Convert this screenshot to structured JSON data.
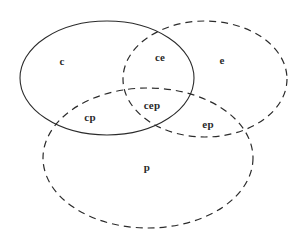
{
  "diagram": {
    "type": "venn-3-set",
    "title": "",
    "background_color": "#ffffff",
    "stroke_color": "#2b2b2b",
    "sets": [
      {
        "id": "c",
        "label": "c",
        "line_style": "solid",
        "cx": 107,
        "cy": 78,
        "rx": 87,
        "ry": 57,
        "rotation": 0
      },
      {
        "id": "e",
        "label": "e",
        "line_style": "dashed",
        "cx": 205,
        "cy": 79,
        "rx": 82,
        "ry": 58,
        "rotation": 0
      },
      {
        "id": "p",
        "label": "p",
        "line_style": "dashed",
        "cx": 148,
        "cy": 158,
        "rx": 105,
        "ry": 70,
        "rotation": 0
      }
    ],
    "regions": [
      {
        "id": "c",
        "label": "c",
        "x": 62,
        "y": 61
      },
      {
        "id": "ce",
        "label": "ce",
        "x": 160,
        "y": 57
      },
      {
        "id": "e",
        "label": "e",
        "x": 222,
        "y": 60
      },
      {
        "id": "cp",
        "label": "cp",
        "x": 90,
        "y": 117
      },
      {
        "id": "cep",
        "label": "cep",
        "x": 152,
        "y": 105
      },
      {
        "id": "ep",
        "label": "ep",
        "x": 208,
        "y": 124
      },
      {
        "id": "p",
        "label": "p",
        "x": 147,
        "y": 167
      }
    ]
  }
}
